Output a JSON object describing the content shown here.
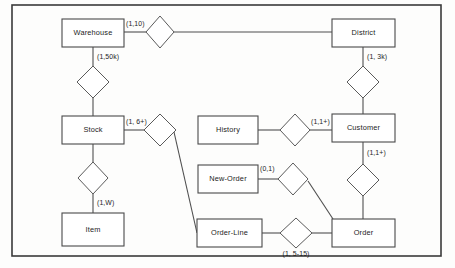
{
  "diagram": {
    "frame": {
      "x": 12,
      "y": 5,
      "width": 429,
      "height": 251
    },
    "colors": {
      "background": "#fdfdfc",
      "box_stroke": "#4a4a4a",
      "diamond_stroke": "#5a5a5a",
      "connector": "#4f4f4f",
      "frame_stroke": "#3a3a3a",
      "text": "#1c1c1c"
    },
    "entities": [
      {
        "id": "warehouse",
        "label": "Warehouse",
        "x": 62,
        "y": 19,
        "width": 62,
        "height": 28
      },
      {
        "id": "district",
        "label": "District",
        "x": 332,
        "y": 19,
        "width": 63,
        "height": 28
      },
      {
        "id": "stock",
        "label": "Stock",
        "x": 62,
        "y": 116,
        "width": 62,
        "height": 28
      },
      {
        "id": "item",
        "label": "Item",
        "x": 62,
        "y": 213,
        "width": 62,
        "height": 33
      },
      {
        "id": "history",
        "label": "History",
        "x": 198,
        "y": 116,
        "width": 60,
        "height": 28
      },
      {
        "id": "customer",
        "label": "Customer",
        "x": 332,
        "y": 114,
        "width": 63,
        "height": 28
      },
      {
        "id": "neworder",
        "label": "New-Order",
        "x": 198,
        "y": 165,
        "width": 60,
        "height": 28
      },
      {
        "id": "orderline",
        "label": "Order-Line",
        "x": 197,
        "y": 219,
        "width": 65,
        "height": 28
      },
      {
        "id": "order",
        "label": "Order",
        "x": 332,
        "y": 219,
        "width": 63,
        "height": 28
      }
    ],
    "relationships": [
      {
        "id": "warehouse-district",
        "cx": 160,
        "cy": 32,
        "rx": 14,
        "ry": 16
      },
      {
        "id": "warehouse-stock",
        "cx": 93,
        "cy": 82,
        "rx": 16,
        "ry": 16
      },
      {
        "id": "district-customer",
        "cx": 363,
        "cy": 82,
        "rx": 16,
        "ry": 16
      },
      {
        "id": "stock-orderline",
        "cx": 160,
        "cy": 130,
        "rx": 16,
        "ry": 16
      },
      {
        "id": "stock-item",
        "cx": 93,
        "cy": 178,
        "rx": 15,
        "ry": 16
      },
      {
        "id": "history-customer",
        "cx": 295,
        "cy": 130,
        "rx": 15,
        "ry": 16
      },
      {
        "id": "neworder-order",
        "cx": 293,
        "cy": 179,
        "rx": 15,
        "ry": 16
      },
      {
        "id": "customer-order",
        "cx": 363,
        "cy": 180,
        "rx": 16,
        "ry": 16
      },
      {
        "id": "orderline-order",
        "cx": 296,
        "cy": 233,
        "rx": 16,
        "ry": 15
      }
    ],
    "connectors": [
      {
        "id": "warehouse-to-wd-diamond",
        "points": "124,32 146,32"
      },
      {
        "id": "wd-diamond-to-district",
        "points": "174,32 332,32"
      },
      {
        "id": "warehouse-to-ws-diamond",
        "points": "93,47 93,66"
      },
      {
        "id": "ws-diamond-to-stock",
        "points": "93,98 93,116"
      },
      {
        "id": "district-to-dc-diamond",
        "points": "363,47 363,66"
      },
      {
        "id": "dc-diamond-to-customer",
        "points": "363,98 363,114"
      },
      {
        "id": "stock-to-so-diamond",
        "points": "124,130 144,130"
      },
      {
        "id": "so-diamond-to-orderline",
        "points": "174,132 197,233"
      },
      {
        "id": "stock-to-si-diamond",
        "points": "93,144 93,162"
      },
      {
        "id": "si-diamond-to-item",
        "points": "93,194 93,213"
      },
      {
        "id": "history-to-hc-diamond",
        "points": "258,130 280,130"
      },
      {
        "id": "hc-diamond-to-customer",
        "points": "310,130 332,130"
      },
      {
        "id": "neworder-to-no-diamond",
        "points": "258,179 278,179"
      },
      {
        "id": "no-diamond-to-order",
        "points": "308,181 333,219"
      },
      {
        "id": "customer-to-co-diamond",
        "points": "363,142 363,164"
      },
      {
        "id": "co-diamond-to-order",
        "points": "363,196 363,219"
      },
      {
        "id": "orderline-to-oo-diamond",
        "points": "262,233 280,233"
      },
      {
        "id": "oo-diamond-to-order",
        "points": "312,233 332,233"
      }
    ],
    "cardinalities": [
      {
        "id": "card-warehouse-district",
        "text": "(1,10)",
        "x": 126,
        "y": 26,
        "anchor": "start"
      },
      {
        "id": "card-warehouse-stock",
        "text": "(1,50k)",
        "x": 97,
        "y": 59,
        "anchor": "start"
      },
      {
        "id": "card-district-customer",
        "text": "(1, 3k)",
        "x": 367,
        "y": 59,
        "anchor": "start"
      },
      {
        "id": "card-stock-orderline",
        "text": "(1, 6+)",
        "x": 126,
        "y": 124,
        "anchor": "start"
      },
      {
        "id": "card-stock-item",
        "text": "(1,W)",
        "x": 97,
        "y": 205,
        "anchor": "start"
      },
      {
        "id": "card-history-customer",
        "text": "(1,1+)",
        "x": 311,
        "y": 124,
        "anchor": "start"
      },
      {
        "id": "card-neworder-order",
        "text": "(0,1)",
        "x": 260,
        "y": 171,
        "anchor": "start"
      },
      {
        "id": "card-customer-order",
        "text": "(1,1+)",
        "x": 367,
        "y": 155,
        "anchor": "start"
      },
      {
        "id": "card-orderline-order",
        "text": "(1, 5-15)",
        "x": 296,
        "y": 256,
        "anchor": "middle"
      }
    ]
  }
}
